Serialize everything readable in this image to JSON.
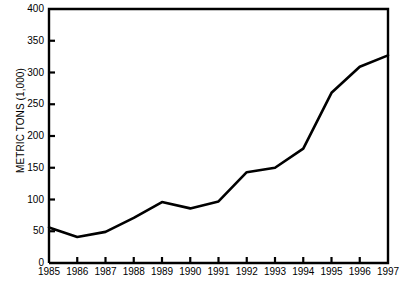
{
  "chart_data": {
    "type": "line",
    "title": "",
    "xlabel": "",
    "ylabel": "METRIC TONS (1,000)",
    "categories": [
      "1985",
      "1986",
      "1987",
      "1988",
      "1989",
      "1990",
      "1991",
      "1992",
      "1993",
      "1994",
      "1995",
      "1996",
      "1997"
    ],
    "x": [
      1985,
      1986,
      1987,
      1988,
      1989,
      1990,
      1991,
      1992,
      1993,
      1994,
      1995,
      1996,
      1997
    ],
    "values": [
      56,
      41,
      49,
      71,
      96,
      86,
      97,
      143,
      150,
      180,
      268,
      309,
      327
    ],
    "series": [
      {
        "name": "Metric tons (1,000)",
        "values": [
          56,
          41,
          49,
          71,
          96,
          86,
          97,
          143,
          150,
          180,
          268,
          309,
          327
        ]
      }
    ],
    "ylim": [
      0,
      400
    ],
    "xlim": [
      1985,
      1997
    ],
    "yticks": [
      0,
      50,
      100,
      150,
      200,
      250,
      300,
      350,
      400
    ],
    "ytick_labels": [
      "0",
      "50",
      "100",
      "150",
      "200",
      "250",
      "300",
      "350",
      "400"
    ],
    "xtick_labels": [
      "1985",
      "1986",
      "1987",
      "1988",
      "1989",
      "1990",
      "1991",
      "1992",
      "1993",
      "1994",
      "1995",
      "1996",
      "1997"
    ],
    "grid": false,
    "legend": false,
    "legend_position": "none",
    "line_color": "#000000",
    "line_width": 2.6,
    "axis_color": "#000000",
    "background_color": "#ffffff"
  },
  "axes": {
    "y_title": "METRIC TONS (1,000)"
  }
}
